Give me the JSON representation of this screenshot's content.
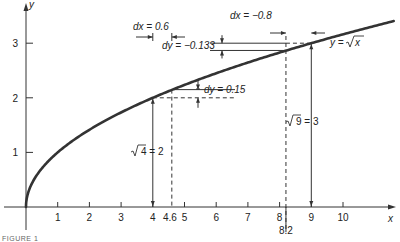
{
  "chart_data": {
    "type": "line",
    "title": "",
    "function": "y = sqrt(x)",
    "curve_label": "y = √x",
    "xlabel": "x",
    "ylabel": "y",
    "xlim": [
      0,
      11.5
    ],
    "ylim": [
      0,
      3.4
    ],
    "x_ticks": [
      1,
      2,
      3,
      4,
      5,
      6,
      7,
      8,
      9,
      10
    ],
    "x_tick_labels": [
      "1",
      "2",
      "3",
      "4",
      "5",
      "6",
      "7",
      "8",
      "9",
      "10"
    ],
    "y_ticks": [
      1,
      2,
      3
    ],
    "y_tick_labels": [
      "1",
      "2",
      "3"
    ],
    "extra_x_labels": [
      {
        "x": 4.6,
        "label": "4.6"
      },
      {
        "x": 8.2,
        "label": "8.2"
      }
    ],
    "series": [
      {
        "name": "y = √x",
        "x": [
          0,
          0.25,
          0.5,
          1,
          2,
          3,
          4,
          5,
          6,
          7,
          8,
          9,
          10,
          11,
          11.6
        ],
        "values": [
          0,
          0.5,
          0.707,
          1,
          1.414,
          1.732,
          2,
          2.236,
          2.449,
          2.646,
          2.828,
          3,
          3.162,
          3.317,
          3.406
        ]
      }
    ],
    "annotations": [
      {
        "text": "dx = 0.6",
        "from_x": 4,
        "to_x": 4.6
      },
      {
        "text": "dy = 0.15",
        "from_y": 2,
        "to_y": 2.15
      },
      {
        "text": "√4 = 2",
        "x": 4,
        "y": 2
      },
      {
        "text": "dx = −0.8",
        "from_x": 9,
        "to_x": 8.2
      },
      {
        "text": "dy = −0.133",
        "from_y": 3,
        "to_y": 2.867
      },
      {
        "text": "√9 = 3",
        "x": 9,
        "y": 3
      }
    ],
    "grid": false,
    "legend": "none"
  },
  "labels": {
    "x_axis": "x",
    "y_axis": "y",
    "curve": "y = √x",
    "dx1": "dx = 0.6",
    "dy1": "dy = 0.15",
    "sqrt4": "4 = 2",
    "dx2": "dx = −0.8",
    "dy2": "dy = −0.133",
    "sqrt9": "9 = 3",
    "x46": "4.6",
    "x82": "8.2",
    "caption": "FIGURE 1"
  }
}
